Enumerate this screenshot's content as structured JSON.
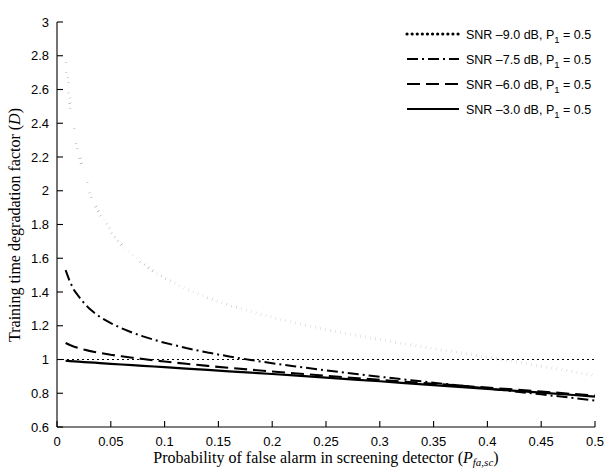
{
  "chart_data": {
    "type": "line",
    "title": "",
    "xlabel": "Probability of false alarm in screening detector (P_fa,sc)",
    "ylabel": "Training time degradation factor (D)",
    "xlim": [
      0,
      0.5
    ],
    "ylim": [
      0.6,
      3
    ],
    "xticks": [
      0,
      0.05,
      0.1,
      0.15,
      0.2,
      0.25,
      0.3,
      0.35,
      0.4,
      0.45,
      0.5
    ],
    "xticklabels": [
      "0",
      "0.05",
      "0.1",
      "0.15",
      "0.2",
      "0.25",
      "0.3",
      "0.35",
      "0.4",
      "0.45",
      "0.5"
    ],
    "yticks": [
      0.6,
      0.8,
      1,
      1.2,
      1.4,
      1.6,
      1.8,
      2,
      2.2,
      2.4,
      2.6,
      2.8,
      3
    ],
    "yticklabels": [
      "0.6",
      "0.8",
      "1",
      "1.2",
      "1.4",
      "1.6",
      "1.8",
      "2",
      "2.2",
      "2.4",
      "2.6",
      "2.8",
      "3"
    ],
    "grid": false,
    "legend_position": "top-right",
    "reference_line": {
      "y": 1.0,
      "style": "dotted"
    },
    "x": [
      0.008,
      0.012,
      0.016,
      0.02,
      0.025,
      0.03,
      0.035,
      0.04,
      0.05,
      0.06,
      0.07,
      0.08,
      0.09,
      0.1,
      0.12,
      0.14,
      0.16,
      0.18,
      0.2,
      0.22,
      0.25,
      0.28,
      0.3,
      0.32,
      0.35,
      0.38,
      0.4,
      0.42,
      0.45,
      0.48,
      0.5
    ],
    "series": [
      {
        "name": "SNR -9.0 dB, P1 = 0.5",
        "linestyle": "dotted",
        "values": [
          2.76,
          2.52,
          2.35,
          2.23,
          2.1,
          2.0,
          1.92,
          1.86,
          1.76,
          1.68,
          1.62,
          1.566,
          1.52,
          1.482,
          1.418,
          1.366,
          1.322,
          1.284,
          1.25,
          1.219,
          1.178,
          1.141,
          1.118,
          1.096,
          1.064,
          1.034,
          1.014,
          0.9935,
          0.9615,
          0.928,
          0.905
        ]
      },
      {
        "name": "SNR -7.5 dB, P1 = 0.5",
        "linestyle": "dashdot",
        "values": [
          1.53,
          1.46,
          1.41,
          1.375,
          1.335,
          1.302,
          1.275,
          1.252,
          1.215,
          1.185,
          1.159,
          1.137,
          1.117,
          1.099,
          1.068,
          1.041,
          1.018,
          0.997,
          0.978,
          0.96,
          0.9355,
          0.9125,
          0.898,
          0.8835,
          0.8625,
          0.842,
          0.8285,
          0.8145,
          0.7935,
          0.7715,
          0.757
        ]
      },
      {
        "name": "SNR -6.0 dB, P1 = 0.5",
        "linestyle": "dashed",
        "values": [
          1.098,
          1.086,
          1.076,
          1.068,
          1.059,
          1.051,
          1.0445,
          1.0385,
          1.028,
          1.019,
          1.0105,
          1.0025,
          0.995,
          0.988,
          0.9745,
          0.962,
          0.9505,
          0.9395,
          0.929,
          0.9185,
          0.9035,
          0.889,
          0.8795,
          0.87,
          0.8565,
          0.8425,
          0.8335,
          0.8245,
          0.8105,
          0.7955,
          0.7855
        ]
      },
      {
        "name": "SNR -3.0 dB, P1 = 0.5",
        "linestyle": "solid",
        "values": [
          0.9925,
          0.9905,
          0.9885,
          0.987,
          0.985,
          0.983,
          0.981,
          0.9785,
          0.9745,
          0.9705,
          0.9665,
          0.9625,
          0.9585,
          0.9545,
          0.9465,
          0.9385,
          0.93,
          0.922,
          0.914,
          0.9055,
          0.8925,
          0.8795,
          0.871,
          0.862,
          0.8485,
          0.835,
          0.826,
          0.817,
          0.8035,
          0.7895,
          0.78
        ]
      }
    ]
  },
  "legend": {
    "entries": [
      {
        "label_prefix": "SNR –9.0 dB, P",
        "sub": "1",
        "label_suffix": " = 0.5",
        "style": "dotted"
      },
      {
        "label_prefix": "SNR –7.5 dB, P",
        "sub": "1",
        "label_suffix": " = 0.5",
        "style": "dashdot"
      },
      {
        "label_prefix": "SNR –6.0 dB, P",
        "sub": "1",
        "label_suffix": " = 0.5",
        "style": "dashed"
      },
      {
        "label_prefix": "SNR –3.0 dB, P",
        "sub": "1",
        "label_suffix": " = 0.5",
        "style": "solid"
      }
    ]
  },
  "axes": {
    "xlabel_main": "Probability of false alarm in screening detector (",
    "xlabel_var": "P",
    "xlabel_sub": "fa,sc",
    "xlabel_close": ")",
    "ylabel_main": "Training time degradation factor (",
    "ylabel_var": "D",
    "ylabel_close": ")"
  },
  "colors": {
    "background": "#ffffff",
    "foreground": "#000000"
  }
}
